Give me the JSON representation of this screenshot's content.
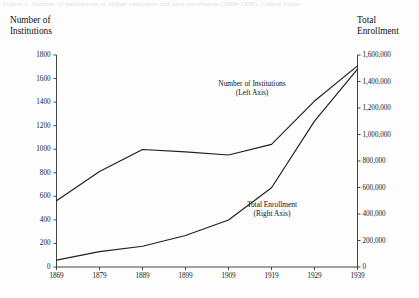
{
  "figure": {
    "cut_caption": "Figure 1.  Number of institutions of higher education and total enrollment (1869-1939), United States",
    "left_axis_title": "Number of\nInstitutions",
    "right_axis_title": "Total\nEnrollment",
    "background_color": "#fdfdfd",
    "line_color": "#1f1f1f",
    "axis_color": "#444444"
  },
  "chart_data": {
    "type": "line",
    "title": "",
    "xlabel": "",
    "grid": false,
    "legend": "inline-annotations",
    "x": [
      1869,
      1879,
      1889,
      1899,
      1909,
      1919,
      1929,
      1939
    ],
    "xtick_labels": [
      "1869",
      "1879",
      "1889",
      "1899",
      "1909",
      "1919",
      "1929",
      "1939"
    ],
    "xlim": [
      1869,
      1939
    ],
    "axes": [
      {
        "id": "left",
        "label": "Number of Institutions",
        "ylim": [
          0,
          1800
        ],
        "ytick_values": [
          0,
          200,
          400,
          600,
          800,
          1000,
          1200,
          1400,
          1600,
          1800
        ],
        "ytick_labels": [
          "0",
          "200",
          "400",
          "600",
          "800",
          "1000",
          "1200",
          "1400",
          "1600",
          "1800"
        ]
      },
      {
        "id": "right",
        "label": "Total Enrollment",
        "ylim": [
          0,
          1600000
        ],
        "ytick_values": [
          0,
          200000,
          400000,
          600000,
          800000,
          1000000,
          1200000,
          1400000,
          1600000
        ],
        "ytick_labels": [
          "0",
          "200,000",
          "400,000",
          "600,000",
          "800,000",
          "1,000,000",
          "1,200,000",
          "1,400,000",
          "1,600,000"
        ]
      }
    ],
    "series": [
      {
        "name": "Number of Institutions",
        "axis": "left",
        "annotation": "Number of Institutions\n(Left Axis)",
        "values": [
          563,
          811,
          998,
          977,
          951,
          1041,
          1409,
          1708
        ]
      },
      {
        "name": "Total Enrollment",
        "axis": "right",
        "annotation": "Total Enrollment\n(Right Axis)",
        "values": [
          52000,
          116000,
          157000,
          238000,
          355000,
          598000,
          1101000,
          1494000
        ]
      }
    ]
  }
}
